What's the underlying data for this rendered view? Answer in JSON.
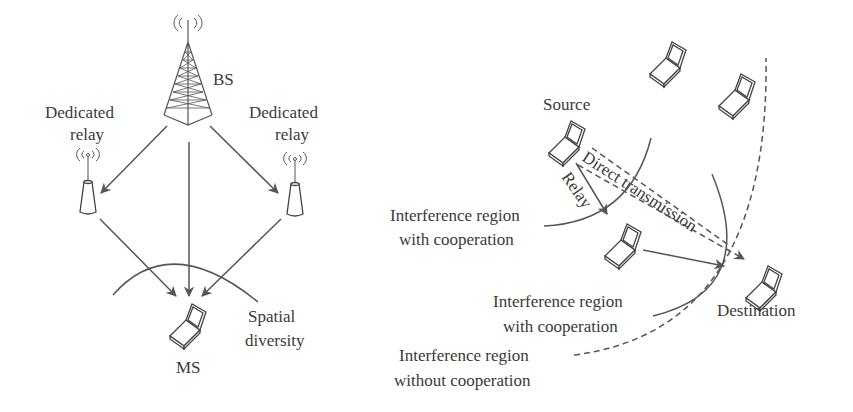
{
  "left_panel": {
    "bs_label": "BS",
    "relay_left_label_1": "Dedicated",
    "relay_left_label_2": "relay",
    "relay_right_label_1": "Dedicated",
    "relay_right_label_2": "relay",
    "ms_label": "MS",
    "diversity_label_1": "Spatial",
    "diversity_label_2": "diversity"
  },
  "right_panel": {
    "source_label": "Source",
    "relay_label": "Relay",
    "direct_label": "Direct transmission",
    "destination_label": "Destination",
    "region_coop_1_line1": "Interference region",
    "region_coop_1_line2": "with cooperation",
    "region_coop_2_line1": "Interference region",
    "region_coop_2_line2": "with cooperation",
    "region_nocoop_line1": "Interference region",
    "region_nocoop_line2": "without cooperation"
  },
  "colors": {
    "stroke": "#555555",
    "text": "#3a3a3a",
    "background": "#ffffff"
  }
}
